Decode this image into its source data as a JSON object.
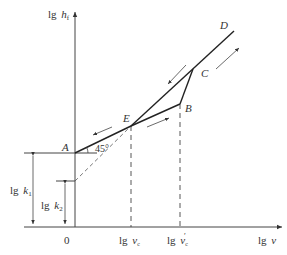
{
  "diagram": {
    "y_axis_label_prefix": "lg",
    "y_axis_label_var": "h",
    "y_axis_label_sub": "f",
    "x_axis_label_prefix": "lg",
    "x_axis_label_var": "v",
    "origin_label": "0",
    "points": {
      "A": "A",
      "B": "B",
      "C": "C",
      "D": "D",
      "E": "E"
    },
    "angle_label": "45°",
    "x_ticks": [
      {
        "prefix": "lg",
        "var": "v",
        "sub": "c",
        "prime": ""
      },
      {
        "prefix": "lg",
        "var": "v",
        "sub": "c",
        "prime": "′"
      }
    ],
    "dimensions": [
      {
        "prefix": "lg",
        "var": "k",
        "sub": "1"
      },
      {
        "prefix": "lg",
        "var": "k",
        "sub": "2"
      }
    ],
    "line_color": "#333333"
  }
}
